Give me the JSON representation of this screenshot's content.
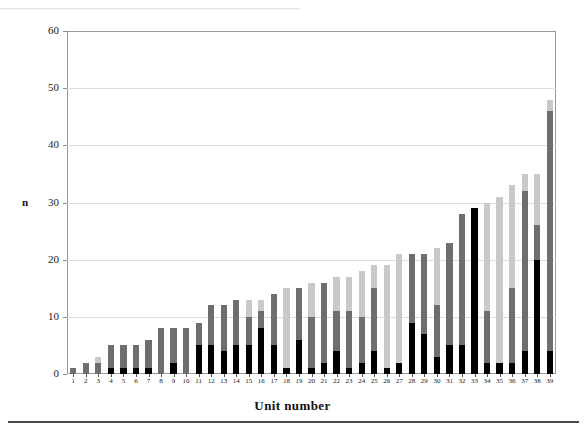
{
  "figure": {
    "y_axis_title": "n",
    "x_axis_title": "Unit number"
  },
  "chart_data": {
    "type": "bar",
    "subtype": "stacked-bar",
    "title": "",
    "xlabel": "Unit number",
    "ylabel": "n",
    "ylim": [
      0,
      60
    ],
    "yticks": [
      0,
      10,
      20,
      30,
      40,
      50,
      60
    ],
    "grid": "horizontal",
    "legend": "none",
    "colors": {
      "series_a": "#000000",
      "series_b": "#6e6e6e",
      "series_c": "#c9c9c9",
      "axis": "#9a9a9a",
      "gridline": "#dcdcdc",
      "text": "#1a1a1a"
    },
    "categories": [
      "1",
      "2",
      "3",
      "4",
      "5",
      "6",
      "7",
      "8",
      "9",
      "10",
      "11",
      "12",
      "13",
      "14",
      "15",
      "16",
      "17",
      "18",
      "19",
      "20",
      "21",
      "22",
      "23",
      "24",
      "25",
      "26",
      "27",
      "28",
      "29",
      "30",
      "31",
      "32",
      "33",
      "34",
      "35",
      "36",
      "37",
      "38",
      "39"
    ],
    "series": [
      {
        "name": "series_a",
        "color": "#000000",
        "values": [
          0,
          0,
          0,
          1,
          1,
          1,
          1,
          0,
          2,
          0,
          5,
          5,
          4,
          5,
          5,
          8,
          5,
          1,
          6,
          1,
          2,
          4,
          1,
          2,
          4,
          1,
          2,
          9,
          7,
          3,
          5,
          5,
          29,
          2,
          2,
          2,
          4,
          20,
          4
        ]
      },
      {
        "name": "series_b",
        "color": "#6e6e6e",
        "values": [
          1,
          2,
          2,
          4,
          4,
          4,
          5,
          8,
          6,
          8,
          4,
          7,
          8,
          8,
          5,
          3,
          9,
          0,
          9,
          9,
          14,
          7,
          10,
          8,
          11,
          0,
          0,
          12,
          14,
          9,
          18,
          23,
          0,
          9,
          0,
          13,
          28,
          6,
          42
        ]
      },
      {
        "name": "series_c",
        "color": "#c9c9c9",
        "values": [
          0,
          0,
          1,
          0,
          0,
          0,
          0,
          0,
          0,
          0,
          0,
          0,
          0,
          0,
          3,
          2,
          0,
          14,
          0,
          6,
          0,
          6,
          6,
          8,
          4,
          18,
          19,
          0,
          0,
          10,
          0,
          0,
          0,
          19,
          29,
          18,
          3,
          9,
          2
        ]
      }
    ],
    "totals": [
      1,
      2,
      3,
      5,
      5,
      5,
      6,
      8,
      8,
      8,
      9,
      12,
      12,
      13,
      13,
      13,
      14,
      15,
      15,
      16,
      16,
      17,
      17,
      18,
      19,
      19,
      21,
      21,
      21,
      22,
      23,
      28,
      29,
      30,
      31,
      33,
      35,
      35,
      48
    ]
  }
}
